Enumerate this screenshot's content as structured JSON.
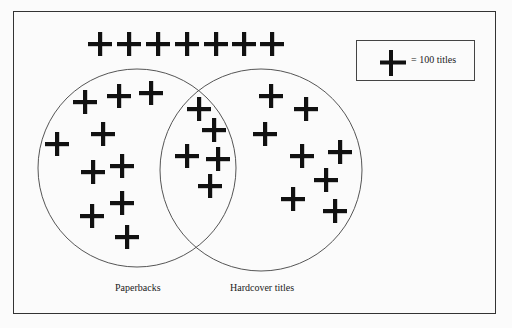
{
  "diagram": {
    "type": "venn-pictogram",
    "legend": {
      "symbol": "plus-icon",
      "text": "= 100 titles"
    },
    "sets": [
      {
        "id": "paperbacks",
        "label": "Paperbacks",
        "cx": 137,
        "cy": 168,
        "r": 99
      },
      {
        "id": "hardcover",
        "label": "Hardcover titles",
        "cx": 261,
        "cy": 170,
        "r": 101
      }
    ],
    "groups": {
      "outside": {
        "count": 7,
        "crosses": [
          [
            100,
            44
          ],
          [
            129,
            44
          ],
          [
            158,
            44
          ],
          [
            187,
            44
          ],
          [
            216,
            44
          ],
          [
            244,
            44
          ],
          [
            272,
            44
          ]
        ]
      },
      "paperbacks_only": {
        "count": 10,
        "crosses": [
          [
            85,
            102
          ],
          [
            119,
            96
          ],
          [
            151,
            93
          ],
          [
            103,
            134
          ],
          [
            57,
            144
          ],
          [
            93,
            172
          ],
          [
            122,
            166
          ],
          [
            122,
            203
          ],
          [
            92,
            216
          ],
          [
            127,
            237
          ]
        ]
      },
      "both": {
        "count": 5,
        "crosses": [
          [
            199,
            109
          ],
          [
            214,
            130
          ],
          [
            187,
            156
          ],
          [
            218,
            159
          ],
          [
            210,
            186
          ]
        ]
      },
      "hardcover_only": {
        "count": 8,
        "crosses": [
          [
            271,
            96
          ],
          [
            306,
            109
          ],
          [
            265,
            134
          ],
          [
            302,
            156
          ],
          [
            340,
            152
          ],
          [
            326,
            180
          ],
          [
            293,
            199
          ],
          [
            335,
            211
          ]
        ]
      }
    },
    "colors": {
      "ink": "#111111",
      "circle": "#555555",
      "background": "#fbfbfb"
    }
  }
}
